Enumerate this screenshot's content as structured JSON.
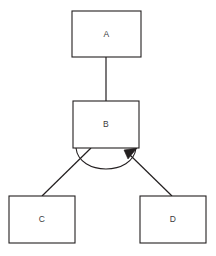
{
  "diagram": {
    "type": "uml-generalization-set",
    "title": "",
    "background_color": "#ffffff",
    "stroke_color": "#231f20",
    "label_color": "#3a3a3c",
    "fill_color": "#ffffff",
    "nodes": [
      {
        "id": "A",
        "label": "A",
        "x": 72,
        "y": 11,
        "width": 69,
        "height": 46
      },
      {
        "id": "B",
        "label": "B",
        "x": 73,
        "y": 101,
        "width": 66,
        "height": 47
      },
      {
        "id": "C",
        "label": "C",
        "x": 9,
        "y": 196,
        "width": 66,
        "height": 47
      },
      {
        "id": "D",
        "label": "D",
        "x": 140,
        "y": 196,
        "width": 66,
        "height": 47
      }
    ],
    "edges": [
      {
        "id": "edge-a-b",
        "from": "A",
        "to": "B",
        "kind": "plain-line",
        "x1": 106,
        "y1": 57,
        "x2": 106,
        "y2": 101,
        "arrow": "none"
      },
      {
        "id": "edge-b-c",
        "from": "B",
        "to": "C",
        "kind": "plain-line",
        "x1": 91,
        "y1": 148,
        "x2": 42,
        "y2": 196,
        "arrow": "none"
      },
      {
        "id": "edge-b-d",
        "from": "D",
        "to": "B",
        "kind": "generalization",
        "x1": 172,
        "y1": 196,
        "x2": 136,
        "y2": 150,
        "arrow": "filled-triangle"
      }
    ],
    "arc": {
      "id": "generalization-set-arc",
      "start_x": 76,
      "start_y": 148,
      "end_x": 136,
      "end_y": 148,
      "lowest_y": 173
    }
  }
}
